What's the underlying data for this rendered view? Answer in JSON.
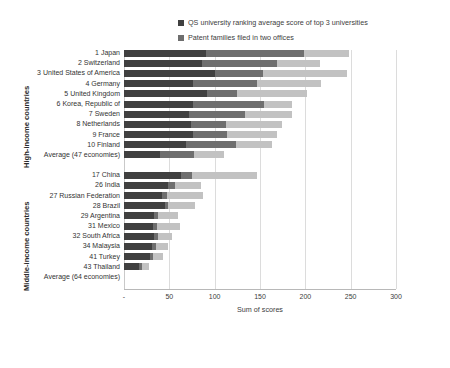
{
  "chart_data": {
    "type": "bar",
    "orientation": "horizontal",
    "stacked": true,
    "title": "",
    "xlabel": "Sum of scores",
    "ylabel": "",
    "xlim": [
      0,
      300
    ],
    "xticks": [
      "-",
      "50",
      "100",
      "150",
      "200",
      "250",
      "300"
    ],
    "xtick_values": [
      0,
      50,
      100,
      150,
      200,
      250,
      300
    ],
    "grid": true,
    "legend_position": "top-right",
    "series": [
      {
        "name": "QS university ranking average score of top 3 universities",
        "color": "#404040",
        "values": [
          90,
          86,
          100,
          76,
          92,
          76,
          72,
          74,
          76,
          68,
          40,
          63,
          48,
          42,
          45,
          33,
          32,
          33,
          31,
          29,
          17
        ]
      },
      {
        "name": "Patent families filed in two offices",
        "color": "#6e6e6e",
        "values": [
          108,
          83,
          53,
          71,
          33,
          78,
          61,
          39,
          38,
          55,
          37,
          12,
          8,
          5,
          4,
          5,
          4,
          4,
          4,
          3,
          3
        ]
      },
      {
        "name": "Citable documents H index",
        "color": "#c2c2c2",
        "values": [
          50,
          47,
          93,
          70,
          77,
          31,
          52,
          61,
          55,
          40,
          33,
          72,
          29,
          40,
          29,
          22,
          26,
          16,
          14,
          11,
          8
        ]
      }
    ],
    "groups": [
      {
        "name": "High-income countries",
        "categories": [
          "1 Japan",
          "2 Switzerland",
          "3 United States of America",
          "4 Germany",
          "5 United Kingdom",
          "6 Korea, Republic of",
          "7 Sweden",
          "8 Netherlands",
          "9 France",
          "10 Finland",
          "Average (47 economies)"
        ]
      },
      {
        "name": "Middle-income countries",
        "categories": [
          "17 China",
          "26 India",
          "27 Russian Federation",
          "28 Brazil",
          "29 Argentina",
          "31 Mexico",
          "32 South Africa",
          "34 Malaysia",
          "41 Turkey",
          "43 Thailand",
          "Average (64 economies)"
        ]
      }
    ]
  },
  "legend": {
    "items": [
      {
        "label": "QS university ranking average score of top 3 universities",
        "color": "#404040"
      },
      {
        "label": "Patent families filed in two offices",
        "color": "#6e6e6e"
      },
      {
        "label": "Citable documents H index",
        "color": "#c2c2c2"
      }
    ]
  },
  "axes": {
    "x_title": "Sum of scores",
    "group_high_label": "High-income countries",
    "group_middle_label": "Middle-income countries"
  }
}
